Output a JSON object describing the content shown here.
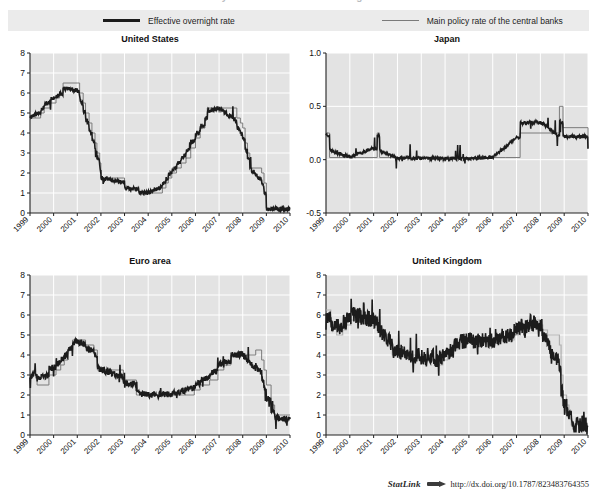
{
  "figure": {
    "cropped_header": "Policy rates and effective overnight rates",
    "legend": [
      {
        "label": "Effective overnight rate",
        "style": "thick-black",
        "color": "#1c1c1c"
      },
      {
        "label": "Main policy rate of the central banks",
        "style": "thin-grey",
        "color": "#7b7b7b"
      }
    ],
    "statlink": {
      "word": "StatLink",
      "glyph": "arrow-logo-icon",
      "url": "http://dx.doi.org/10.1787/823483764355"
    },
    "colors": {
      "plot_background": "#e3e3e3",
      "gridlines": "#ffffff",
      "legend_band": "#ebebeb",
      "effective_rate": "#1c1c1c",
      "policy_rate": "#7b7b7b",
      "axis": "#222222"
    }
  },
  "chart_data": [
    {
      "id": "united-states",
      "type": "line",
      "title": "United States",
      "xlabel": "",
      "ylabel": "",
      "ylim": [
        0,
        8
      ],
      "yticks": [
        0,
        1,
        2,
        3,
        4,
        5,
        6,
        7,
        8
      ],
      "ytick_labels": [
        "0",
        "1",
        "2",
        "3",
        "4",
        "5",
        "6",
        "7",
        "8"
      ],
      "xlim": [
        1999,
        2010
      ],
      "xticks": [
        1999,
        2000,
        2001,
        2002,
        2003,
        2004,
        2005,
        2006,
        2007,
        2008,
        2009,
        2010
      ],
      "xtick_labels": [
        "1999",
        "2000",
        "2001",
        "2002",
        "2003",
        "2004",
        "2005",
        "2006",
        "2007",
        "2008",
        "2009",
        "2010"
      ],
      "grid": true,
      "legend_position": "figure-top",
      "series": [
        {
          "name": "Main policy rate of the central banks",
          "x": [
            1999.0,
            1999.45,
            1999.6,
            1999.85,
            2000.1,
            2000.25,
            2000.4,
            2001.0,
            2001.1,
            2001.25,
            2001.35,
            2001.5,
            2001.62,
            2001.75,
            2001.83,
            2001.95,
            2002.0,
            2002.95,
            2003.0,
            2003.5,
            2003.6,
            2004.5,
            2004.6,
            2004.75,
            2004.85,
            2005.0,
            2005.2,
            2005.4,
            2005.6,
            2005.8,
            2006.0,
            2006.2,
            2006.4,
            2006.5,
            2007.0,
            2007.6,
            2007.75,
            2007.9,
            2008.0,
            2008.1,
            2008.2,
            2008.3,
            2008.8,
            2008.9,
            2009.0,
            2010.0
          ],
          "y": [
            4.75,
            5.0,
            5.25,
            5.5,
            5.75,
            6.0,
            6.5,
            6.5,
            6.0,
            5.5,
            5.0,
            4.5,
            4.0,
            3.5,
            3.0,
            2.5,
            1.75,
            1.75,
            1.25,
            1.25,
            1.0,
            1.0,
            1.25,
            1.5,
            1.75,
            2.0,
            2.25,
            2.5,
            2.75,
            3.25,
            3.75,
            4.25,
            4.75,
            5.25,
            5.25,
            5.25,
            4.75,
            4.5,
            4.25,
            3.5,
            3.0,
            2.25,
            2.0,
            1.5,
            0.25,
            0.25
          ],
          "color": "#7b7b7b",
          "linewidth": 1.0
        },
        {
          "name": "Effective overnight rate",
          "description": "Daily effective federal funds rate; tracks the policy rate with frequent spikes and dips, notably 1999-2000 volatility, a deep 2001-2003 decline to ~1%, a 2004-2006 climb back above 5%, then a collapse to near 0 in late 2008.",
          "color": "#1c1c1c",
          "linewidth": 1.6,
          "anchor_values": {
            "1999": 4.9,
            "2000": 6.1,
            "2001": 5.6,
            "2002": 1.75,
            "2003": 1.2,
            "2004": 1.0,
            "2005": 2.3,
            "2006": 4.3,
            "2007": 5.25,
            "2008": 3.1,
            "2009": 0.15,
            "2010": 0.12
          }
        }
      ]
    },
    {
      "id": "japan",
      "type": "line",
      "title": "Japan",
      "xlabel": "",
      "ylabel": "",
      "ylim": [
        -0.5,
        1.0
      ],
      "yticks": [
        -0.5,
        0.0,
        0.5,
        1.0
      ],
      "ytick_labels": [
        "-0.5",
        "0.0",
        "0.5",
        "1.0"
      ],
      "xlim": [
        1999,
        2010
      ],
      "xticks": [
        1999,
        2000,
        2001,
        2002,
        2003,
        2004,
        2005,
        2006,
        2007,
        2008,
        2009,
        2010
      ],
      "xtick_labels": [
        "1999",
        "2000",
        "2001",
        "2002",
        "2003",
        "2004",
        "2005",
        "2006",
        "2007",
        "2008",
        "2009",
        "2010"
      ],
      "grid": true,
      "legend_position": "figure-top",
      "series": [
        {
          "name": "Main policy rate of the central banks",
          "x": [
            1999.0,
            1999.15,
            2000.6,
            2001.15,
            2001.25,
            2006.55,
            2007.15,
            2008.8,
            2008.95,
            2010.0
          ],
          "y": [
            0.25,
            0.02,
            0.02,
            0.25,
            0.02,
            0.02,
            0.25,
            0.5,
            0.3,
            0.1
          ],
          "color": "#7b7b7b",
          "linewidth": 1.0
        },
        {
          "name": "Effective overnight rate",
          "description": "Japanese uncollateralised overnight call rate: ~0.25 briefly in early 1999, then pinned near zero through 2000, a ~0.25 plateau mid-2000 to early 2001, zero through 2006, rising to ~0.25 in 2006-07 and ~0.5 in 2007-08, then falling back toward ~0.1 after late 2008.",
          "color": "#1c1c1c",
          "linewidth": 1.6,
          "anchor_values": {
            "1999": 0.22,
            "2000": 0.03,
            "2001": 0.24,
            "2002": 0.01,
            "2003": 0.0,
            "2004": 0.0,
            "2005": 0.0,
            "2006": 0.02,
            "2007": 0.47,
            "2008": 0.5,
            "2009": 0.1,
            "2010": 0.1
          }
        }
      ]
    },
    {
      "id": "euro-area",
      "type": "line",
      "title": "Euro area",
      "xlabel": "",
      "ylabel": "",
      "ylim": [
        0,
        8
      ],
      "yticks": [
        0,
        1,
        2,
        3,
        4,
        5,
        6,
        7,
        8
      ],
      "ytick_labels": [
        "0",
        "1",
        "2",
        "3",
        "4",
        "5",
        "6",
        "7",
        "8"
      ],
      "xlim": [
        1999,
        2010
      ],
      "xticks": [
        1999,
        2000,
        2001,
        2002,
        2003,
        2004,
        2005,
        2006,
        2007,
        2008,
        2009,
        2010
      ],
      "xtick_labels": [
        "1999",
        "2000",
        "2001",
        "2002",
        "2003",
        "2004",
        "2005",
        "2006",
        "2007",
        "2008",
        "2009",
        "2010"
      ],
      "grid": true,
      "legend_position": "figure-top",
      "series": [
        {
          "name": "Main policy rate of the central banks",
          "x": [
            1999.0,
            1999.3,
            1999.8,
            2000.1,
            2000.3,
            2000.45,
            2000.6,
            2000.8,
            2001.35,
            2001.7,
            2001.85,
            2002.95,
            2003.5,
            2005.95,
            2006.2,
            2006.6,
            2006.95,
            2007.2,
            2007.5,
            2008.55,
            2008.8,
            2008.9,
            2009.0,
            2009.2,
            2009.35,
            2010.0
          ],
          "y": [
            3.0,
            2.5,
            3.0,
            3.25,
            3.5,
            3.75,
            4.25,
            4.75,
            4.5,
            4.25,
            3.25,
            2.75,
            2.0,
            2.25,
            2.5,
            2.75,
            3.25,
            3.5,
            4.0,
            4.25,
            3.75,
            3.25,
            2.5,
            1.5,
            1.0,
            1.0
          ],
          "color": "#7b7b7b",
          "linewidth": 1.0
        },
        {
          "name": "Effective overnight rate",
          "description": "EONIA: ~3% at the start of 1999 dipping to ~2.5% in mid-1999, climbing to a ~5% plateau (spikes to 5.8) in 2000-01, falling to ~3.3% in 2002, ~2% through 2004-05, rising back to ~4.3% by 2008, then collapsing to ~0.4% in 2009.",
          "color": "#1c1c1c",
          "linewidth": 1.6,
          "anchor_values": {
            "1999": 2.9,
            "2000": 3.9,
            "2001": 4.6,
            "2002": 3.3,
            "2003": 2.4,
            "2004": 2.05,
            "2005": 2.1,
            "2006": 2.9,
            "2007": 3.9,
            "2008": 4.1,
            "2009": 0.9,
            "2010": 0.45
          }
        }
      ]
    },
    {
      "id": "united-kingdom",
      "type": "line",
      "title": "United Kingdom",
      "xlabel": "",
      "ylabel": "",
      "ylim": [
        0,
        8
      ],
      "yticks": [
        0,
        1,
        2,
        3,
        4,
        5,
        6,
        7,
        8
      ],
      "ytick_labels": [
        "0",
        "1",
        "2",
        "3",
        "4",
        "5",
        "6",
        "7",
        "8"
      ],
      "xlim": [
        1999,
        2010
      ],
      "xticks": [
        1999,
        2000,
        2001,
        2002,
        2003,
        2004,
        2005,
        2006,
        2007,
        2008,
        2009,
        2010
      ],
      "xtick_labels": [
        "1999",
        "2000",
        "2001",
        "2002",
        "2003",
        "2004",
        "2005",
        "2006",
        "2007",
        "2008",
        "2009",
        "2010"
      ],
      "grid": true,
      "legend_position": "figure-top",
      "series": [
        {
          "name": "Main policy rate of the central banks",
          "x": [
            1999.0,
            1999.2,
            1999.45,
            1999.7,
            1999.85,
            2000.05,
            2000.15,
            2001.1,
            2001.25,
            2001.4,
            2001.55,
            2001.7,
            2001.78,
            2001.85,
            2003.1,
            2003.55,
            2003.9,
            2004.1,
            2004.35,
            2004.5,
            2004.6,
            2006.6,
            2006.9,
            2007.1,
            2007.4,
            2007.55,
            2007.95,
            2008.1,
            2008.3,
            2008.8,
            2008.87,
            2008.95,
            2009.1,
            2009.2,
            2009.3,
            2010.0
          ],
          "y": [
            6.25,
            5.5,
            5.0,
            5.25,
            5.5,
            5.75,
            6.0,
            5.75,
            5.25,
            5.0,
            4.75,
            4.5,
            4.0,
            4.0,
            3.75,
            3.5,
            3.75,
            4.0,
            4.25,
            4.5,
            4.75,
            4.75,
            5.0,
            5.25,
            5.5,
            5.75,
            5.5,
            5.25,
            5.0,
            4.5,
            3.0,
            2.0,
            1.5,
            1.0,
            0.5,
            0.5
          ],
          "color": "#b0b0b0",
          "linewidth": 1.2
        },
        {
          "name": "Effective overnight rate",
          "description": "SONIA: very volatile band around the Bank Rate, ~5-7% in 1999, ~6-6.8% in 2000-01, a wide noisy 3-5% band in 2002-04, ~4.5-5% in 2005-06, peaking ~6.5% in 2007, then dropping sharply to ~0.45% from mid-2009.",
          "color": "#1c1c1c",
          "linewidth": 1.6,
          "anchor_values": {
            "1999": 5.6,
            "2000": 6.2,
            "2001": 5.4,
            "2002": 4.4,
            "2003": 3.8,
            "2004": 4.4,
            "2005": 4.75,
            "2006": 4.7,
            "2007": 5.7,
            "2008": 5.2,
            "2009": 0.6,
            "2010": 0.45
          }
        }
      ]
    }
  ]
}
